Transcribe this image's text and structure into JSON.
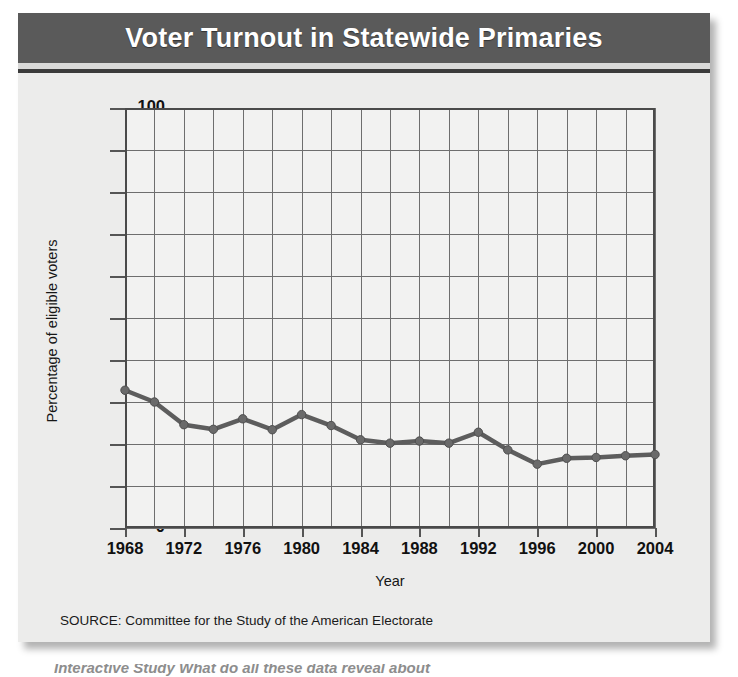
{
  "card": {
    "title": "Voter Turnout in Statewide Primaries",
    "source_note": "SOURCE: Committee for the Study of the American Electorate",
    "page_footer_partial": "Interactive Study  What do all these data reveal about"
  },
  "colors": {
    "title_band": "#5a5a5a",
    "title_text": "#ffffff",
    "card_background": "#ececeb",
    "plot_background": "#f2f2f1",
    "gridline": "#6e6e6e",
    "axis": "#4a4a4a",
    "series_line": "#5d5d5d",
    "series_marker": "#6a6a6a"
  },
  "chart_data": {
    "type": "line",
    "title": "Voter Turnout in Statewide Primaries",
    "xlabel": "Year",
    "ylabel": "Percentage of eligible voters",
    "ylim": [
      0,
      100
    ],
    "ytick_labels": [
      "0",
      "10",
      "20",
      "30",
      "40",
      "50",
      "60",
      "70",
      "80",
      "90",
      "100"
    ],
    "ytick_values": [
      0,
      10,
      20,
      30,
      40,
      50,
      60,
      70,
      80,
      90,
      100
    ],
    "xlim": [
      1968,
      2004
    ],
    "xtick_labels": [
      "1968",
      "1972",
      "1976",
      "1980",
      "1984",
      "1988",
      "1992",
      "1996",
      "2000",
      "2004"
    ],
    "xtick_values": [
      1968,
      1972,
      1976,
      1980,
      1984,
      1988,
      1992,
      1996,
      2000,
      2004
    ],
    "grid": true,
    "grid_x_step": 2,
    "grid_y_step": 10,
    "legend": false,
    "x": [
      1968,
      1970,
      1972,
      1974,
      1976,
      1978,
      1980,
      1982,
      1984,
      1986,
      1988,
      1990,
      1992,
      1994,
      1996,
      1998,
      2000,
      2002,
      2004
    ],
    "values": [
      32.8,
      30.0,
      24.6,
      23.5,
      26.0,
      23.4,
      27.0,
      24.4,
      21.0,
      20.2,
      20.7,
      20.2,
      22.8,
      18.6,
      15.2,
      16.6,
      16.8,
      17.2,
      17.5
    ],
    "marker": "circle",
    "source": "SOURCE: Committee for the Study of the American Electorate"
  }
}
